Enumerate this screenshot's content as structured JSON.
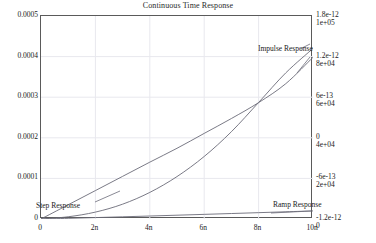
{
  "chart_data": {
    "type": "line",
    "title": "Continuous Time Response",
    "xlabel": "",
    "ylabel": "",
    "grid": true,
    "legend_position": "inline-annotations",
    "x": [
      0,
      1e-09,
      2e-09,
      3e-09,
      4e-09,
      5e-09,
      6e-09,
      7e-09,
      8e-09,
      9e-09,
      1e-08
    ],
    "x_axis": {
      "min": 0,
      "max": 1e-08,
      "ticks": [
        0,
        2e-09,
        4e-09,
        6e-09,
        8e-09,
        1e-08
      ],
      "tick_labels": [
        "0",
        "2n",
        "4n",
        "6n",
        "8n",
        "10n"
      ]
    },
    "y_axis_left": {
      "min": 0,
      "max": 0.0005,
      "ticks": [
        0,
        0.0001,
        0.0002,
        0.0003,
        0.0004,
        0.0005
      ],
      "tick_labels": [
        "0",
        "0.0001",
        "0.0002",
        "0.0003",
        "0.0004",
        "0.0005"
      ]
    },
    "y_axis_right_1": {
      "min": -1.2e-12,
      "max": 1.8e-12,
      "ticks": [
        -1.2e-12,
        -6e-13,
        0,
        6e-13,
        1.2e-12,
        1.8e-12
      ],
      "tick_labels": [
        "-1.2e-12",
        "-6e-13",
        "0",
        "6e-13",
        "1.2e-12",
        "1.8e-12"
      ]
    },
    "y_axis_right_2": {
      "min": 0,
      "max": 100000,
      "ticks": [
        0,
        20000,
        40000,
        60000,
        80000,
        100000
      ],
      "tick_labels": [
        "0",
        "2e+04",
        "4e+04",
        "6e+04",
        "8e+04",
        "1e+05"
      ]
    },
    "series": [
      {
        "name": "Step Response",
        "axis": "left",
        "label_x": 1e-09,
        "label_y": 2.25e-05,
        "values": [
          0,
          5.5e-06,
          1.7e-05,
          3.65e-05,
          6.55e-05,
          0.0001045,
          0.000154,
          0.000215,
          0.000287,
          0.00036,
          0.00042
        ]
      },
      {
        "name": "Impulse Response",
        "axis": "right_1",
        "label_x": 7.6e-09,
        "label_y": 1.28e-12,
        "values": [
          -1.2e-12,
          -9.9e-13,
          -7.8e-13,
          -5.7e-13,
          -3.6e-13,
          -1.55e-13,
          6.5e-14,
          2.85e-13,
          5.2e-13,
          8e-13,
          1.19e-12
        ]
      },
      {
        "name": "Ramp Response",
        "axis": "right_2",
        "label_x": 7.9e-09,
        "label_y": 6200,
        "values": [
          0,
          330,
          700,
          1080,
          1470,
          1870,
          2280,
          2700,
          3120,
          3550,
          3980
        ]
      }
    ]
  },
  "colors": {
    "axis": "#5a5a5a",
    "grid": "#e8e8ee",
    "curve": "#6b6b78",
    "text": "#1a1a1a"
  }
}
